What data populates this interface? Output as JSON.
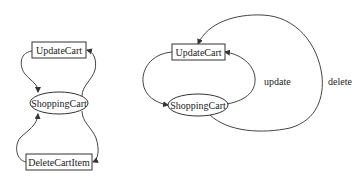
{
  "diagram": {
    "type": "state-diagram",
    "colors": {
      "stroke": "#333333",
      "background": "#ffffff",
      "text": "#222222"
    },
    "left": {
      "nodes": {
        "update_cart": "UpdateCart",
        "shopping_cart": "ShoppingCart",
        "delete_cart_item": "DeleteCartItem"
      },
      "edges": [
        {
          "from": "UpdateCart",
          "to": "ShoppingCart",
          "label": ""
        },
        {
          "from": "ShoppingCart",
          "to": "UpdateCart",
          "label": ""
        },
        {
          "from": "DeleteCartItem",
          "to": "ShoppingCart",
          "label": ""
        },
        {
          "from": "ShoppingCart",
          "to": "DeleteCartItem",
          "label": ""
        }
      ]
    },
    "right": {
      "nodes": {
        "update_cart": "UpdateCart",
        "shopping_cart": "ShoppingCart"
      },
      "edges": [
        {
          "from": "UpdateCart",
          "to": "ShoppingCart",
          "label": ""
        },
        {
          "from": "ShoppingCart",
          "to": "UpdateCart",
          "label": "update"
        },
        {
          "from": "ShoppingCart",
          "to": "UpdateCart",
          "label": "delete"
        }
      ],
      "labels": {
        "update": "update",
        "delete": "delete"
      }
    }
  }
}
